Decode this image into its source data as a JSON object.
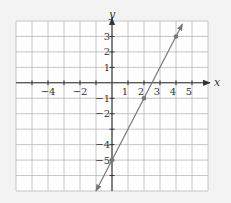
{
  "chart_data": {
    "type": "line",
    "title": "",
    "xlabel": "x",
    "ylabel": "y",
    "xlim": [
      -6,
      6
    ],
    "ylim": [
      -7,
      4
    ],
    "grid": true,
    "x_tick_labels": [
      {
        "value": -4,
        "label": "−4"
      },
      {
        "value": -2,
        "label": "−2"
      },
      {
        "value": 1,
        "label": "1"
      },
      {
        "value": 2,
        "label": "2"
      },
      {
        "value": 3,
        "label": "3"
      },
      {
        "value": 4,
        "label": "4"
      },
      {
        "value": 5,
        "label": "5"
      }
    ],
    "y_tick_labels": [
      {
        "value": 3,
        "label": "3"
      },
      {
        "value": 2,
        "label": "2"
      },
      {
        "value": 1,
        "label": "1"
      },
      {
        "value": -1,
        "label": "−1"
      },
      {
        "value": -2,
        "label": "−2"
      },
      {
        "value": -4,
        "label": "−4"
      },
      {
        "value": -5,
        "label": "−5"
      }
    ],
    "series": [
      {
        "name": "y = 2x − 5",
        "equation": {
          "slope": 2,
          "intercept": -5
        },
        "line_x_range": [
          -1,
          4.4
        ],
        "points": [
          {
            "x": 0,
            "y": -5
          },
          {
            "x": 2,
            "y": -1
          },
          {
            "x": 4,
            "y": 3
          }
        ],
        "arrows_both_ends": true
      }
    ],
    "legend": null
  },
  "colors": {
    "background": "#f3f3f3",
    "plot_background": "#ffffff",
    "grid": "#b8b8b8",
    "axis": "#333333",
    "line": "#777777",
    "point": "#777777"
  }
}
